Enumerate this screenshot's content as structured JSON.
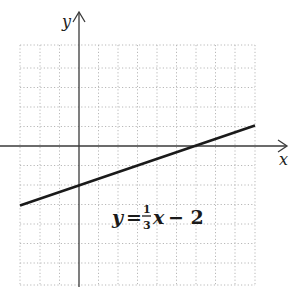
{
  "axes": {
    "x_label": "x",
    "y_label": "y"
  },
  "equation": {
    "lhs": "y",
    "equals": "=",
    "frac_num": "1",
    "frac_den": "3",
    "var": "x",
    "rest": "− 2",
    "full": "y = (1/3)x − 2"
  },
  "graph": {
    "slope": "1/3",
    "y_intercept": -2,
    "x_range_units": [
      -3,
      9
    ],
    "y_range_units": [
      -7,
      5
    ],
    "grid": true
  }
}
